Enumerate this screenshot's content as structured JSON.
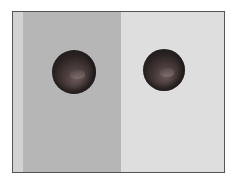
{
  "image": {
    "description": "Simultaneous contrast illusion: two identical dark spheres on dark-gray and light-gray backgrounds",
    "backgrounds": {
      "left": "#b6b6b6",
      "right": "#dedede",
      "edge_strip": "#d2d2d2"
    },
    "spheres": [
      {
        "position": "left",
        "color": "#2c2424"
      },
      {
        "position": "right",
        "color": "#2c2424"
      }
    ]
  }
}
